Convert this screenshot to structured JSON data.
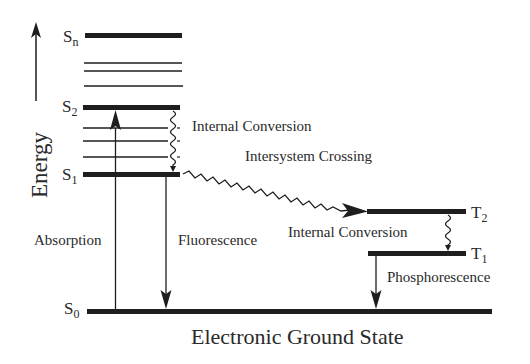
{
  "diagram": {
    "type": "jablonski",
    "axis": {
      "label": "Energy"
    },
    "singlet_states": [
      {
        "name": "Sn",
        "base": "S",
        "sub": "n"
      },
      {
        "name": "S2",
        "base": "S",
        "sub": "2"
      },
      {
        "name": "S1",
        "base": "S",
        "sub": "1"
      },
      {
        "name": "S0",
        "base": "S",
        "sub": "0"
      }
    ],
    "triplet_states": [
      {
        "name": "T2",
        "base": "T",
        "sub": "2"
      },
      {
        "name": "T1",
        "base": "T",
        "sub": "1"
      }
    ],
    "processes": {
      "internal_conversion_singlet": "Internal Conversion",
      "intersystem_crossing": "Intersystem Crossing",
      "absorption": "Absorption",
      "fluorescence": "Fluorescence",
      "internal_conversion_triplet": "Internal Conversion",
      "phosphorescence": "Phosphorescence"
    },
    "ground_state_label": "Electronic Ground State",
    "colors": {
      "ink": "#1e1e1e",
      "background": "#ffffff"
    }
  }
}
